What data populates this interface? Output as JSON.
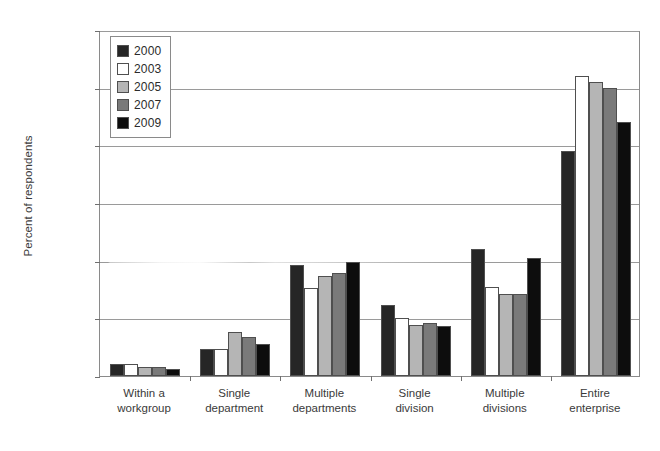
{
  "chart_data": {
    "type": "bar",
    "title": "",
    "subtitle": "",
    "xlabel": "",
    "ylabel": "Percent of respondents",
    "ylim": [
      0,
      60
    ],
    "ytick_labels": [
      "0%",
      "10%",
      "20%",
      "30%",
      "40%",
      "50%",
      "60%"
    ],
    "ytick_values": [
      0,
      10,
      20,
      30,
      40,
      50,
      60
    ],
    "grid": true,
    "grid_axis": "y",
    "legend_position": "top-left",
    "categories": [
      "Within a workgroup",
      "Single department",
      "Multiple departments",
      "Single division",
      "Multiple divisions",
      "Entire enterprise"
    ],
    "category_lines": [
      [
        "Within a",
        "workgroup"
      ],
      [
        "Single",
        "department"
      ],
      [
        "Multiple",
        "departments"
      ],
      [
        "Single",
        "division"
      ],
      [
        "Multiple",
        "divisions"
      ],
      [
        "Entire",
        "enterprise"
      ]
    ],
    "series": [
      {
        "name": "2000",
        "color": "#262626",
        "values": [
          2.0,
          4.7,
          19.3,
          12.3,
          22.0,
          39.0
        ]
      },
      {
        "name": "2003",
        "color": "#ffffff",
        "values": [
          2.0,
          4.7,
          15.3,
          10.0,
          15.4,
          52.0
        ]
      },
      {
        "name": "2005",
        "color": "#b5b5b5",
        "values": [
          1.5,
          7.7,
          17.3,
          8.8,
          14.2,
          51.0
        ]
      },
      {
        "name": "2007",
        "color": "#7a7a7a",
        "values": [
          1.6,
          6.8,
          17.8,
          9.2,
          14.3,
          50.0
        ]
      },
      {
        "name": "2009",
        "color": "#0d0d0d",
        "values": [
          1.2,
          5.5,
          19.8,
          8.7,
          20.4,
          44.0
        ]
      }
    ]
  },
  "legend": {
    "items": [
      {
        "label": "2000",
        "color": "#262626"
      },
      {
        "label": "2003",
        "color": "#ffffff"
      },
      {
        "label": "2005",
        "color": "#b5b5b5"
      },
      {
        "label": "2007",
        "color": "#7a7a7a"
      },
      {
        "label": "2009",
        "color": "#0d0d0d"
      }
    ]
  }
}
